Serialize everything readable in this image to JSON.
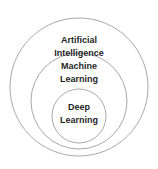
{
  "diagram": {
    "type": "nested-circles",
    "background": "#ffffff",
    "stroke_color": "#a8a8a8",
    "text_color": "#1f1f1f",
    "circles": [
      {
        "label": "Artificial Intelligence",
        "line1": "Artificial",
        "line2": "Intelligence",
        "level": "outer"
      },
      {
        "label": "Machine Learning",
        "line1": "Machine",
        "line2": "Learning",
        "level": "middle"
      },
      {
        "label": "Deep Learning",
        "line1": "Deep",
        "line2": "Learning",
        "level": "inner"
      }
    ]
  }
}
